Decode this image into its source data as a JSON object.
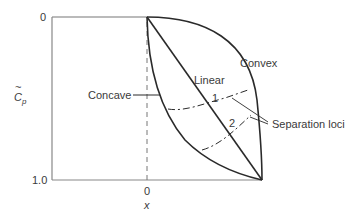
{
  "diagram": {
    "y_axis": {
      "label_main": "C",
      "label_sub": "p",
      "label_accent": "~",
      "tick_top": "0",
      "tick_bottom": "1.0"
    },
    "x_axis": {
      "tick_zero": "0",
      "label": "x"
    },
    "curves": {
      "convex": "Convex",
      "linear": "Linear",
      "concave": "Concave"
    },
    "loci": {
      "label": "Separation loci",
      "locus1": "1",
      "locus2": "2"
    },
    "colors": {
      "axis": "#888888",
      "curve": "#2a2a2a",
      "text": "#3a3a3a"
    }
  }
}
